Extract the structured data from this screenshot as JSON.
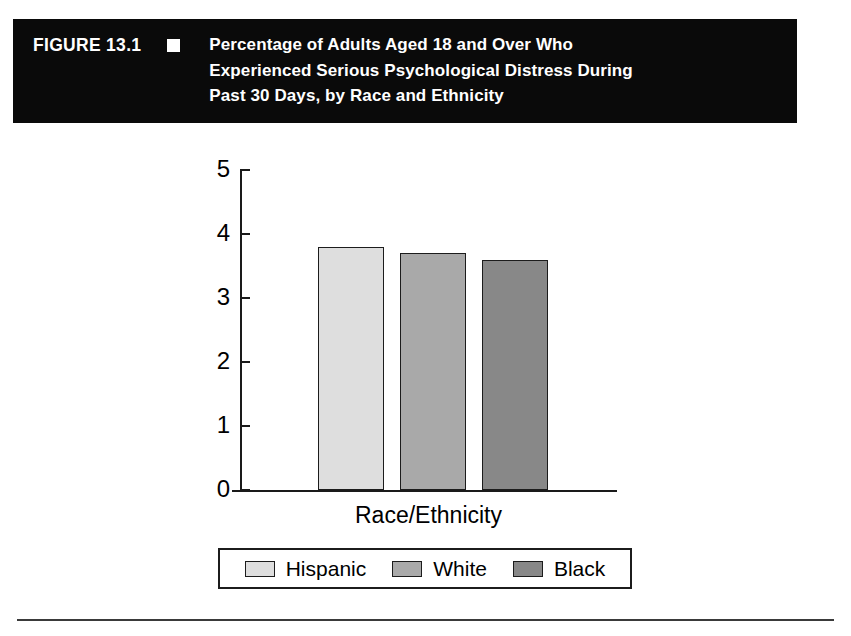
{
  "figure": {
    "number_label": "FIGURE 13.1",
    "bullet_icon": "square-bullet-icon",
    "title_line_1": "Percentage of Adults Aged 18 and Over Who",
    "title_line_2": "Experienced Serious Psychological Distress During",
    "title_line_3": "Past 30 Days, by Race and Ethnicity",
    "header_background": "#0a0a0a",
    "header_text_color": "#ffffff"
  },
  "chart_data": {
    "type": "bar",
    "title": "Percentage of Adults Aged 18 and Over Who Experienced Serious Psychological Distress During Past 30 Days, by Race and Ethnicity",
    "categories": [
      "Hispanic",
      "White",
      "Black"
    ],
    "values": [
      3.8,
      3.7,
      3.6
    ],
    "series": [
      {
        "name": "Percentage of adults with serious psychological distress",
        "values": [
          3.8,
          3.7,
          3.6
        ]
      }
    ],
    "xlabel": "Race/Ethnicity",
    "ylabel": "",
    "ylim": [
      0,
      5
    ],
    "yticks": [
      "0",
      "1",
      "2",
      "3",
      "4",
      "5"
    ],
    "ytick_values": [
      0,
      1,
      2,
      3,
      4,
      5
    ],
    "xtick_labels": [],
    "grid": false,
    "legend_position": "bottom",
    "colors": [
      "#dedede",
      "#a9a9a9",
      "#888888"
    ],
    "bar_edge_color": "#1c1c1c",
    "axis_color": "#1a1a1a"
  },
  "axis": {
    "x_label": "Race/Ethnicity"
  },
  "legend": {
    "items": [
      {
        "label": "Hispanic",
        "color": "#dedede"
      },
      {
        "label": "White",
        "color": "#a9a9a9"
      },
      {
        "label": "Black",
        "color": "#888888"
      }
    ]
  }
}
